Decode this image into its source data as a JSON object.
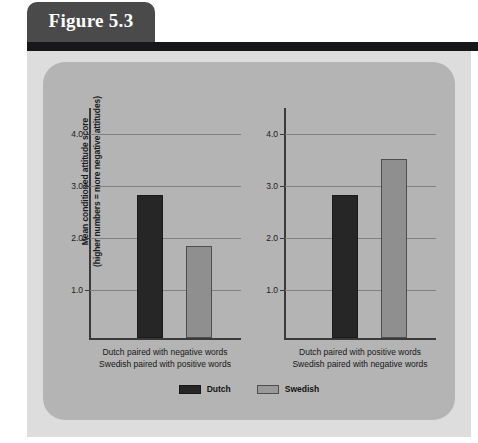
{
  "figure": {
    "tab_label": "Figure 5.3"
  },
  "chart_data": {
    "type": "bar",
    "title": "Figure 5.3",
    "xlabel": "",
    "ylabel": "Mean conditioned attitude score (higher numbers = more negative attitudes)",
    "ylabel_line1": "Mean conditioned attitude score",
    "ylabel_line2": "(higher numbers = more negative attitudes)",
    "ylim": [
      0,
      4.5
    ],
    "yticks": [
      1.0,
      2.0,
      3.0,
      4.0
    ],
    "ytick_labels": [
      "1.0",
      "2.0",
      "3.0",
      "4.0"
    ],
    "grid": true,
    "legend_position": "bottom-center",
    "series": [
      {
        "name": "Dutch",
        "color": "#262626",
        "values": [
          2.75,
          2.75
        ]
      },
      {
        "name": "Swedish",
        "color": "#8f8f8f",
        "values": [
          1.78,
          3.45
        ]
      }
    ],
    "panels": [
      {
        "caption_line1": "Dutch paired with negative words",
        "caption_line2": "Swedish paired with positive words",
        "bars": [
          {
            "series": "Dutch",
            "value": 2.75
          },
          {
            "series": "Swedish",
            "value": 1.78
          }
        ]
      },
      {
        "caption_line1": "Dutch paired with positive words",
        "caption_line2": "Swedish paired with negative words",
        "bars": [
          {
            "series": "Dutch",
            "value": 2.75
          },
          {
            "series": "Swedish",
            "value": 3.45
          }
        ]
      }
    ],
    "legend": [
      {
        "label": "Dutch",
        "color": "#262626"
      },
      {
        "label": "Swedish",
        "color": "#8f8f8f"
      }
    ]
  }
}
